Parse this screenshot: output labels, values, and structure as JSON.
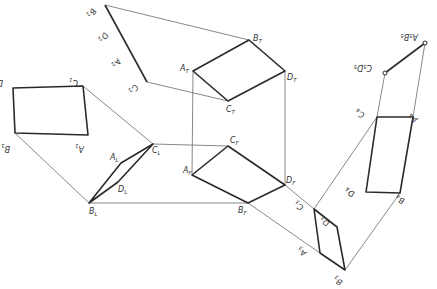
{
  "diagram": {
    "title": "",
    "views": {
      "view1": {
        "points": {
          "D1": [
            13,
            88
          ],
          "C1": [
            83,
            86
          ],
          "A1": [
            88,
            135
          ],
          "B1": [
            15,
            133
          ]
        }
      },
      "view2": {
        "points": {
          "B2": [
            105,
            5
          ],
          "D2": [
            118,
            32
          ],
          "A2": [
            130,
            55
          ],
          "C2": [
            147,
            82
          ]
        }
      },
      "top": {
        "points": {
          "AT": [
            193,
            71
          ],
          "BT": [
            249,
            40
          ],
          "DT": [
            285,
            71
          ],
          "CT": [
            228,
            101
          ]
        }
      },
      "front": {
        "points": {
          "AF": [
            192,
            175
          ],
          "CF": [
            228,
            146
          ],
          "DF": [
            285,
            185
          ],
          "BF": [
            248,
            203
          ]
        }
      },
      "left": {
        "points": {
          "AL": [
            121,
            163
          ],
          "CL": [
            153,
            144
          ],
          "DL": [
            118,
            182
          ],
          "BL": [
            89,
            203
          ]
        }
      },
      "view3": {
        "points": {
          "C3": [
            314,
            209
          ],
          "D3": [
            337,
            227
          ],
          "B3": [
            345,
            270
          ],
          "A3": [
            320,
            253
          ]
        }
      },
      "view4": {
        "points": {
          "C4": [
            377,
            117
          ],
          "A4": [
            413,
            117
          ],
          "B4": [
            400,
            193
          ],
          "D4": [
            366,
            192
          ]
        }
      },
      "view5": {
        "points": {
          "C5D5": [
            385,
            73
          ],
          "A5B5": [
            425,
            43
          ]
        }
      }
    },
    "labels": [
      {
        "id": "D1",
        "base": "D",
        "sub": "1",
        "x": 3,
        "y": 80,
        "rot": 180
      },
      {
        "id": "C1",
        "base": "C",
        "sub": "1",
        "x": 78,
        "y": 80,
        "rot": 180
      },
      {
        "id": "A1",
        "base": "A",
        "sub": "1",
        "x": 84,
        "y": 146,
        "rot": 180
      },
      {
        "id": "B1",
        "base": "B",
        "sub": "1",
        "x": 10,
        "y": 146,
        "rot": 180
      },
      {
        "id": "B2",
        "base": "B",
        "sub": "2",
        "x": 92,
        "y": 8,
        "rot": 120
      },
      {
        "id": "D2",
        "base": "D",
        "sub": "2",
        "x": 104,
        "y": 32,
        "rot": 120
      },
      {
        "id": "A2",
        "base": "A",
        "sub": "2",
        "x": 117,
        "y": 58,
        "rot": 120
      },
      {
        "id": "C2",
        "base": "C",
        "sub": "2",
        "x": 134,
        "y": 84,
        "rot": 120
      },
      {
        "id": "AT",
        "base": "A",
        "sub": "T",
        "x": 180,
        "y": 71,
        "rot": 0
      },
      {
        "id": "BT",
        "base": "B",
        "sub": "T",
        "x": 253,
        "y": 41,
        "rot": 0
      },
      {
        "id": "DT",
        "base": "D",
        "sub": "T",
        "x": 287,
        "y": 80,
        "rot": 0
      },
      {
        "id": "CT",
        "base": "C",
        "sub": "T",
        "x": 226,
        "y": 112,
        "rot": 0
      },
      {
        "id": "AF",
        "base": "A",
        "sub": "F",
        "x": 183,
        "y": 173,
        "rot": 0
      },
      {
        "id": "CF",
        "base": "C",
        "sub": "F",
        "x": 230,
        "y": 143,
        "rot": 0
      },
      {
        "id": "DF",
        "base": "D",
        "sub": "F",
        "x": 286,
        "y": 183,
        "rot": 0
      },
      {
        "id": "BF",
        "base": "B",
        "sub": "F",
        "x": 238,
        "y": 213,
        "rot": 0
      },
      {
        "id": "AL",
        "base": "A",
        "sub": "L",
        "x": 110,
        "y": 160,
        "rot": 0
      },
      {
        "id": "CL",
        "base": "C",
        "sub": "L",
        "x": 152,
        "y": 153,
        "rot": 0
      },
      {
        "id": "DL",
        "base": "D",
        "sub": "L",
        "x": 118,
        "y": 192,
        "rot": 0
      },
      {
        "id": "BL",
        "base": "B",
        "sub": "L",
        "x": 89,
        "y": 214,
        "rot": 0
      },
      {
        "id": "C3",
        "base": "C",
        "sub": "3",
        "x": 304,
        "y": 206,
        "rot": 210
      },
      {
        "id": "D3",
        "base": "D",
        "sub": "3",
        "x": 330,
        "y": 222,
        "rot": 210
      },
      {
        "id": "A3",
        "base": "A",
        "sub": "3",
        "x": 307,
        "y": 252,
        "rot": 210
      },
      {
        "id": "B3",
        "base": "B",
        "sub": "3",
        "x": 343,
        "y": 281,
        "rot": 210
      },
      {
        "id": "C4",
        "base": "C",
        "sub": "4",
        "x": 365,
        "y": 113,
        "rot": 200
      },
      {
        "id": "A4",
        "base": "A",
        "sub": "4",
        "x": 418,
        "y": 118,
        "rot": 200
      },
      {
        "id": "B4",
        "base": "B",
        "sub": "4",
        "x": 405,
        "y": 199,
        "rot": 200
      },
      {
        "id": "D4",
        "base": "D",
        "sub": "4",
        "x": 355,
        "y": 192,
        "rot": 200
      },
      {
        "id": "C5D5",
        "base": "C₅D₅",
        "sub": "",
        "x": 372,
        "y": 65,
        "rot": 180
      },
      {
        "id": "A5B5",
        "base": "A₅B₅",
        "sub": "",
        "x": 418,
        "y": 34,
        "rot": 180
      }
    ]
  }
}
